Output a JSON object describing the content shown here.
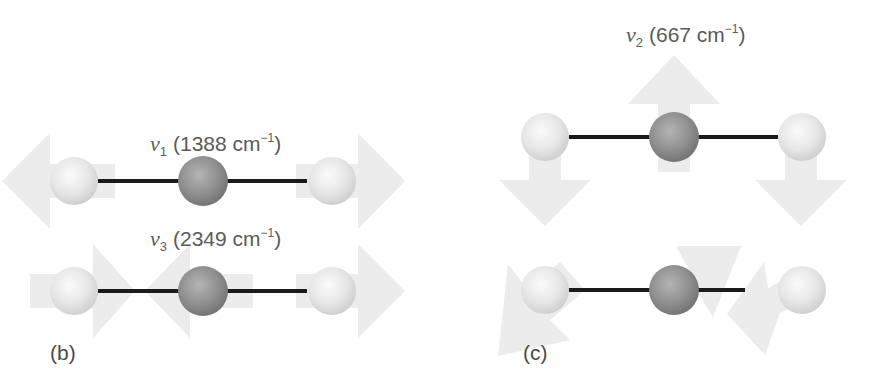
{
  "panels": {
    "b": {
      "label": "(b)",
      "modes": [
        {
          "symbol": "v",
          "subscript": "1",
          "wavenumber": "(1388 cm",
          "unit_exp": "−1",
          "close": ")",
          "name": "symmetric stretch"
        },
        {
          "symbol": "v",
          "subscript": "3",
          "wavenumber": "(2349 cm",
          "unit_exp": "−1",
          "close": ")",
          "name": "asymmetric stretch"
        }
      ]
    },
    "c": {
      "label": "(c)",
      "modes": [
        {
          "symbol": "v",
          "subscript": "2",
          "wavenumber": "(667 cm",
          "unit_exp": "−1",
          "close": ")",
          "name": "bending"
        }
      ]
    }
  },
  "atoms": {
    "oxygen_color": "#e4e4e4",
    "carbon_color": "#8e8e8e",
    "arrow_color": "#ececec",
    "bond_color": "#1a1a1a"
  }
}
